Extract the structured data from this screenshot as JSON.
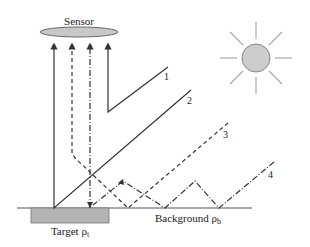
{
  "diagram": {
    "sensor": {
      "label": "Sensor",
      "fill": "#c8c8c8",
      "stroke": "#666666"
    },
    "sun": {
      "fill": "#cccccc",
      "stroke": "#888888",
      "ray_color": "#aaaaaa"
    },
    "target": {
      "label": "Target ρ",
      "subscript": "t",
      "fill": "#b4b4b4"
    },
    "background": {
      "label": "Background ρ",
      "subscript": "b"
    },
    "paths": [
      {
        "id": "1",
        "label": "1",
        "style": "solid"
      },
      {
        "id": "2",
        "label": "2",
        "style": "solid"
      },
      {
        "id": "3",
        "label": "3",
        "style": "dashed"
      },
      {
        "id": "4",
        "label": "4",
        "style": "dash-dot"
      }
    ],
    "line_color": "#333333"
  }
}
